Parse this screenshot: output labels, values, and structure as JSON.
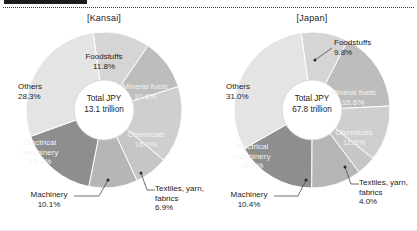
{
  "header": {
    "crop_bar_visible": true,
    "ghost_text": ""
  },
  "panels": [
    {
      "id": "kansai",
      "title": "[Kansai]",
      "center_line1": "Total JPY",
      "center_line2": "13.1 trillion"
    },
    {
      "id": "japan",
      "title": "[Japan]",
      "center_line1": "Total JPY",
      "center_line2": "67.8 trillion"
    }
  ],
  "chart_data": [
    {
      "type": "pie",
      "title": "[Kansai]",
      "subtitle": "Total JPY 13.1 trillion",
      "total_label": "Total JPY",
      "total_value": "13.1 trillion",
      "categories": [
        "Foodstuffs",
        "Mineral fuels",
        "Chemicals",
        "Textiles, yarn, fabrics",
        "Machinery",
        "Electrical machinery",
        "Others"
      ],
      "values": [
        11.8,
        10.6,
        16.0,
        6.9,
        10.1,
        16.4,
        28.3
      ],
      "value_labels": [
        "11.8%",
        "10.6%",
        "16.0%",
        "6.9%",
        "10.1%",
        "16.4%",
        "28.3%"
      ],
      "colors": [
        "#d5d5d5",
        "#bdbdbd",
        "#cfcfcf",
        "#c6c6c6",
        "#b6b6b6",
        "#8e8e8e",
        "#e4e4e4"
      ],
      "legend": "none",
      "donut": true
    },
    {
      "type": "pie",
      "title": "[Japan]",
      "subtitle": "Total JPY 67.8 trillion",
      "total_label": "Total JPY",
      "total_value": "67.8 trillion",
      "categories": [
        "Foodstuffs",
        "Mineral fuels",
        "Chemicals",
        "Textiles, yarn, fabrics",
        "Machinery",
        "Electrical machinery",
        "Others"
      ],
      "values": [
        9.8,
        16.6,
        11.5,
        4.0,
        10.4,
        16.7,
        31.0
      ],
      "value_labels": [
        "9.8%",
        "16.6%",
        "11.5%",
        "4.0%",
        "10.4%",
        "16.7%",
        "31.0%"
      ],
      "colors": [
        "#d5d5d5",
        "#bdbdbd",
        "#cfcfcf",
        "#c6c6c6",
        "#b6b6b6",
        "#8e8e8e",
        "#e4e4e4"
      ],
      "legend": "none",
      "donut": true
    }
  ],
  "labels": {
    "kansai": {
      "foodstuffs_name": "Foodstuffs",
      "foodstuffs_pct": "11.8%",
      "mineral_name": "Mineral fuels",
      "mineral_pct": "10.6%",
      "chemicals_name": "Chemicals",
      "chemicals_pct": "16.0%",
      "textiles_name1": "Textiles, yarn,",
      "textiles_name2": "fabrics",
      "textiles_pct": "6.9%",
      "machinery_name": "Machinery",
      "machinery_pct": "10.1%",
      "elec_name1": "Electrical",
      "elec_name2": "machinery",
      "elec_pct": "16.4%",
      "others_name": "Others",
      "others_pct": "28.3%"
    },
    "japan": {
      "foodstuffs_name": "Foodstuffs",
      "foodstuffs_pct": "9.8%",
      "mineral_name": "Mineral fuels",
      "mineral_pct": "16.6%",
      "chemicals_name": "Chemicals",
      "chemicals_pct": "11.5%",
      "textiles_name1": "Textiles, yarn,",
      "textiles_name2": "fabrics",
      "textiles_pct": "4.0%",
      "machinery_name": "Machinery",
      "machinery_pct": "10.4%",
      "elec_name1": "Electrical",
      "elec_name2": "machinery",
      "elec_pct": "16.7%",
      "others_name": "Others",
      "others_pct": "31.0%"
    }
  }
}
